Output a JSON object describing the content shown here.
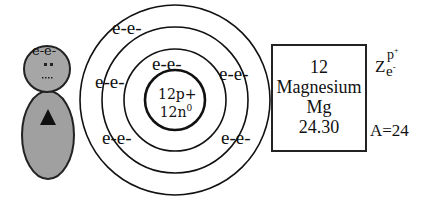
{
  "figure": {
    "left_icon": {
      "head_label": "e-e-",
      "head_color": "#a6a6a6",
      "body_color": "#a0a0a0"
    },
    "atom": {
      "nucleus": {
        "protons": "12p+",
        "neutrons_base": "12n",
        "neutrons_sup": "0"
      },
      "shells": [
        {
          "electrons": [
            "e-e-"
          ]
        },
        {
          "electrons": [
            "e-e-",
            "e-e-",
            "e-e-"
          ]
        },
        {
          "electrons": [
            "e-e-",
            "e-e-",
            "e-e-"
          ]
        }
      ],
      "labels": {
        "outer_top": "e-e-",
        "inner_top": "e-e-",
        "mid_left": "e-e-",
        "mid_right": "e-e-",
        "low_left": "e-e-",
        "low_right": "e-e-"
      }
    },
    "element_card": {
      "atomic_number": "12",
      "name": "Magnesium",
      "symbol": "Mg",
      "atomic_mass": "24.30"
    },
    "legend": {
      "z": "Z",
      "p_sup": "p",
      "p_charge": "+",
      "e_sub": "e",
      "e_charge": "-",
      "mass_number": "A=24"
    }
  }
}
